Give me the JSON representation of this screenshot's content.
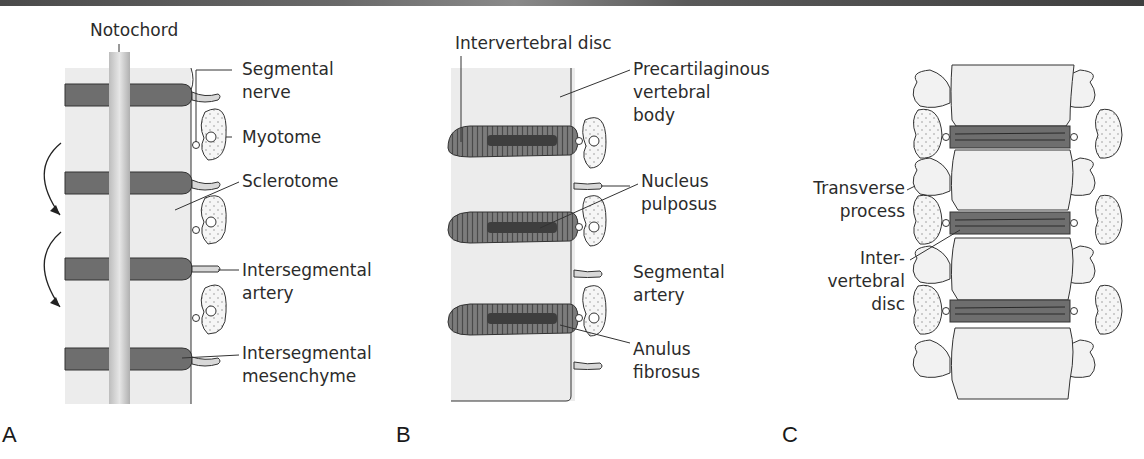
{
  "figure": {
    "panels": [
      {
        "id": "A",
        "letter": "A",
        "labels": {
          "notochord": "Notochord",
          "segmental_nerve_1": "Segmental",
          "segmental_nerve_2": "nerve",
          "myotome": "Myotome",
          "sclerotome": "Sclerotome",
          "intersegmental_artery_1": "Intersegmental",
          "intersegmental_artery_2": "artery",
          "intersegmental_mesenchyme_1": "Intersegmental",
          "intersegmental_mesenchyme_2": "mesenchyme"
        }
      },
      {
        "id": "B",
        "letter": "B",
        "labels": {
          "intervertebral_disc": "Intervertebral disc",
          "precartilaginous_1": "Precartilaginous",
          "precartilaginous_2": "vertebral",
          "precartilaginous_3": "body",
          "nucleus_1": "Nucleus",
          "nucleus_2": "pulposus",
          "segmental_artery_1": "Segmental",
          "segmental_artery_2": "artery",
          "anulus_1": "Anulus",
          "anulus_2": "fibrosus"
        }
      },
      {
        "id": "C",
        "letter": "C",
        "labels": {
          "transverse_1": "Transverse",
          "transverse_2": "process",
          "inter_disc_1": "Inter-",
          "inter_disc_2": "vertebral",
          "inter_disc_3": "disc"
        }
      }
    ],
    "colors": {
      "tissue": "#ececec",
      "segment_dark": "#6e6e6e",
      "notochord": "#cfcfcf",
      "disc_outer": "#7a7a7a",
      "nucleus": "#3e3e3e",
      "outline": "#333333"
    }
  }
}
